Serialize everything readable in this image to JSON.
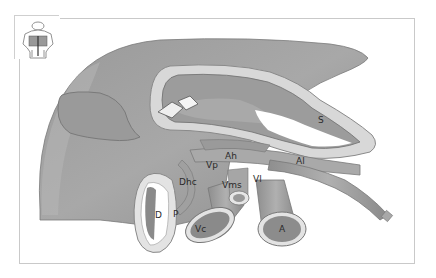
{
  "figure": {
    "orientation_icon": "torso-orientation-icon",
    "labels": {
      "S": "S",
      "Ah": "Ah",
      "Al": "Al",
      "Vp": "Vp",
      "Vl": "Vl",
      "Vms": "Vms",
      "Dhc": "Dhc",
      "D": "D",
      "P": "P",
      "Vc": "Vc",
      "A": "A"
    },
    "colors": {
      "organ_dark": "#8a8a8a",
      "organ_mid": "#a6a6a6",
      "organ_light": "#c4c4c4",
      "wall": "#dedede",
      "frame": "#c9c9c9",
      "label": "#2a2a2a"
    }
  }
}
